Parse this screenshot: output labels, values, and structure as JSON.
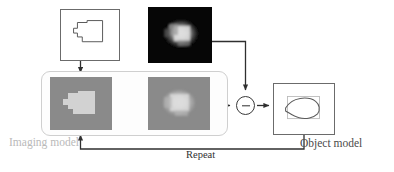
{
  "figure": {
    "type": "block-diagram",
    "title_visible": false,
    "background_color": "#ffffff"
  },
  "labels": {
    "imaging_model": "Imaging model",
    "object_model": "Object model",
    "repeat": "Repeat"
  },
  "colors": {
    "imaging_model_label": "#b9b9b9",
    "object_model_label": "#4a4a4a",
    "repeat_label": "#303030",
    "wire": "#2f2f2f",
    "box_border": "#6b6b6b",
    "rounded_container_border": "#cfcfcf",
    "gray_panel_background": "#8a8a8a",
    "gray_panel_shape": "#d2d2d2",
    "noisy_image_background": "#050505",
    "noisy_image_blob": "#e6e6e6"
  },
  "nodes": {
    "object_shape_box": {
      "name": "Object shape (binary polygon)",
      "icon": "notched-rectangle-outline",
      "fill": "none",
      "stroke": "#555555"
    },
    "noisy_image_box": {
      "name": "Noisy measured image",
      "icon": "blurred-bright-blob-on-black",
      "background": "#050505"
    },
    "imaging_input_panel": {
      "name": "Imaging model input (sharp object)",
      "icon": "light-notched-rectangle-on-gray"
    },
    "imaging_output_panel": {
      "name": "Imaging model output (blurred prediction)",
      "icon": "blurred-light-blob-on-gray"
    },
    "subtract_node": {
      "name": "Difference / residual operator",
      "glyph": "minus",
      "symbol": "−"
    },
    "object_model_box": {
      "name": "Object model estimate",
      "icon": "irregular-blob-outline-with-faint-rectangle"
    }
  },
  "edges": [
    {
      "from": "object_shape_box",
      "to": "imaging_input_panel",
      "style": "solid-arrow",
      "direction": "down"
    },
    {
      "from": "noisy_image_box",
      "to": "subtract_node",
      "style": "solid-arrow",
      "direction": "right-then-down"
    },
    {
      "from": "imaging_input_panel",
      "to": "imaging_output_panel",
      "style": "solid-arrow",
      "direction": "right"
    },
    {
      "from": "imaging_output_panel",
      "to": "subtract_node",
      "style": "solid-arrow",
      "direction": "right"
    },
    {
      "from": "subtract_node",
      "to": "object_model_box",
      "style": "solid-arrow",
      "direction": "right"
    },
    {
      "from": "object_model_box",
      "to": "imaging_input_panel",
      "style": "solid-arrow",
      "direction": "feedback-loop-bottom",
      "label": "Repeat"
    }
  ]
}
